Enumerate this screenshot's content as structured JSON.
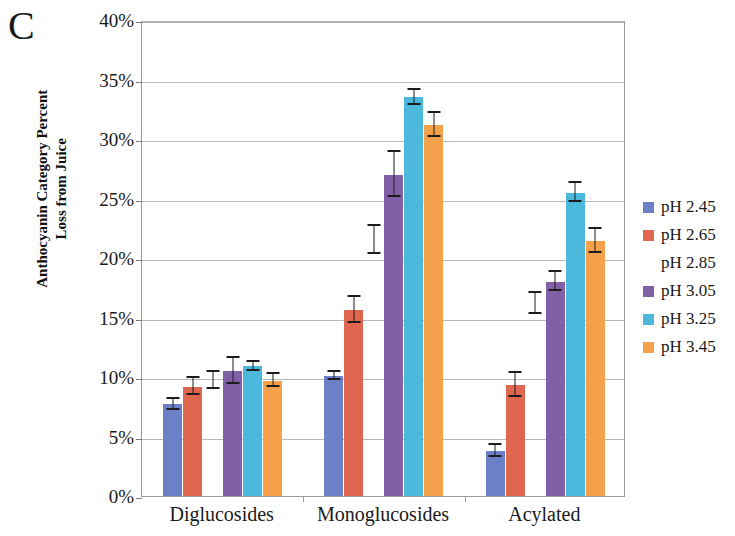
{
  "panel": {
    "label": "C"
  },
  "axes": {
    "y_title_line1": "Anthocyanin Category Percent",
    "y_title_line2": "Loss from Juice",
    "y_ticks": [
      "0%",
      "5%",
      "10%",
      "15%",
      "20%",
      "25%",
      "30%",
      "35%",
      "40%"
    ]
  },
  "legend": {
    "items": [
      {
        "label": "pH 2.45",
        "color": "#6b80c6"
      },
      {
        "label": "pH 2.65",
        "color": "#e0674f"
      },
      {
        "label": "pH 2.85",
        "color": "#9ec martin"
      },
      {
        "label": "pH 3.05",
        "color": "#8160a8"
      },
      {
        "label": "pH 3.25",
        "color": "#4cb8db"
      },
      {
        "label": "pH 3.45",
        "color": "#f5a04b"
      }
    ]
  },
  "chart_data": {
    "type": "bar",
    "title": "",
    "xlabel": "",
    "ylabel": "Anthocyanin Category Percent Loss from Juice",
    "ylim": [
      0,
      40
    ],
    "ytick_step": 5,
    "grid": true,
    "legend_position": "right",
    "categories": [
      "Diglucosides",
      "Monoglucosides",
      "Acylated"
    ],
    "series": [
      {
        "name": "pH 2.45",
        "color": "#6b80c6",
        "values": [
          7.7,
          10.1,
          3.8
        ],
        "errors": [
          0.45,
          0.35,
          0.5
        ]
      },
      {
        "name": "pH 2.65",
        "color": "#e0674f",
        "values": [
          9.2,
          15.6,
          9.3
        ],
        "errors": [
          0.75,
          1.1,
          1.0
        ]
      },
      {
        "name": "pH 2.85",
        "color": "#9ec martin",
        "values": [
          9.7,
          21.5,
          16.2
        ],
        "errors": [
          0.7,
          1.2,
          0.9
        ]
      },
      {
        "name": "pH 3.05",
        "color": "#8160a8",
        "values": [
          10.5,
          27.0,
          18.0
        ],
        "errors": [
          1.1,
          1.9,
          0.8
        ]
      },
      {
        "name": "pH 3.25",
        "color": "#4cb8db",
        "values": [
          10.9,
          33.5,
          25.5
        ],
        "errors": [
          0.4,
          0.6,
          0.8
        ]
      },
      {
        "name": "pH 3.45",
        "color": "#f5a04b",
        "values": [
          9.7,
          31.2,
          21.4
        ],
        "errors": [
          0.55,
          1.0,
          1.0
        ]
      }
    ]
  }
}
